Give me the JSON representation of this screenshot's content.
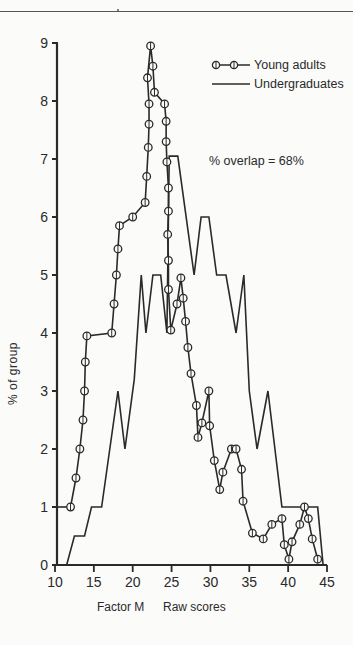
{
  "chart_data": {
    "type": "line",
    "title": "",
    "xlabel": "Factor M     Raw scores",
    "xlabel_parts": [
      "Factor M",
      "Raw scores"
    ],
    "ylabel": "% of group",
    "xlim": [
      10,
      45
    ],
    "ylim": [
      0,
      9
    ],
    "x_ticks": [
      10,
      15,
      20,
      25,
      30,
      35,
      40,
      45
    ],
    "y_ticks": [
      0,
      1,
      2,
      3,
      4,
      5,
      6,
      7,
      8,
      9
    ],
    "grid": false,
    "legend_position": "upper right",
    "annotation": "% overlap = 68%",
    "series": [
      {
        "name": "Young adults",
        "style": "line-with-open-circles",
        "points": [
          [
            12.0,
            1.0
          ],
          [
            12.7,
            1.5
          ],
          [
            13.2,
            2.0
          ],
          [
            13.6,
            2.5
          ],
          [
            13.8,
            3.0
          ],
          [
            13.9,
            3.5
          ],
          [
            14.1,
            3.95
          ],
          [
            17.3,
            4.0
          ],
          [
            17.6,
            4.5
          ],
          [
            17.9,
            5.0
          ],
          [
            18.1,
            5.45
          ],
          [
            18.3,
            5.85
          ],
          [
            20.0,
            6.0
          ],
          [
            21.6,
            6.25
          ],
          [
            21.8,
            6.7
          ],
          [
            22.0,
            7.2
          ],
          [
            22.1,
            7.6
          ],
          [
            22.1,
            7.95
          ],
          [
            21.9,
            8.4
          ],
          [
            22.3,
            8.95
          ],
          [
            22.6,
            8.6
          ],
          [
            22.8,
            8.15
          ],
          [
            24.1,
            7.95
          ],
          [
            24.3,
            7.65
          ],
          [
            24.3,
            7.3
          ],
          [
            24.4,
            6.95
          ],
          [
            24.6,
            6.5
          ],
          [
            24.6,
            6.1
          ],
          [
            24.5,
            5.7
          ],
          [
            24.6,
            5.25
          ],
          [
            24.6,
            4.75
          ],
          [
            24.9,
            4.05
          ],
          [
            25.7,
            4.5
          ],
          [
            26.2,
            4.95
          ],
          [
            26.5,
            4.6
          ],
          [
            26.8,
            4.2
          ],
          [
            27.1,
            3.75
          ],
          [
            27.5,
            3.3
          ],
          [
            28.2,
            2.75
          ],
          [
            28.4,
            2.2
          ],
          [
            28.9,
            2.45
          ],
          [
            29.8,
            3.0
          ],
          [
            29.9,
            2.4
          ],
          [
            30.5,
            1.8
          ],
          [
            31.2,
            1.3
          ],
          [
            31.6,
            1.6
          ],
          [
            32.7,
            2.0
          ],
          [
            33.3,
            2.0
          ],
          [
            34.0,
            1.65
          ],
          [
            34.2,
            1.1
          ],
          [
            35.4,
            0.55
          ],
          [
            36.8,
            0.45
          ],
          [
            37.9,
            0.7
          ],
          [
            39.2,
            0.8
          ],
          [
            39.5,
            0.35
          ],
          [
            40.1,
            0.1
          ],
          [
            40.5,
            0.4
          ],
          [
            41.5,
            0.7
          ],
          [
            42.1,
            1.0
          ],
          [
            42.6,
            0.8
          ],
          [
            43.1,
            0.45
          ],
          [
            43.8,
            0.1
          ]
        ]
      },
      {
        "name": "Undergraduates",
        "style": "plain-line",
        "points": [
          [
            11.5,
            0.0
          ],
          [
            12.5,
            0.5
          ],
          [
            13.8,
            0.5
          ],
          [
            14.7,
            1.0
          ],
          [
            16.0,
            1.0
          ],
          [
            18.1,
            3.0
          ],
          [
            19.0,
            2.0
          ],
          [
            20.2,
            3.2
          ],
          [
            21.1,
            5.0
          ],
          [
            21.7,
            4.0
          ],
          [
            22.6,
            5.0
          ],
          [
            23.6,
            5.0
          ],
          [
            24.4,
            4.0
          ],
          [
            24.7,
            7.05
          ],
          [
            25.8,
            7.05
          ],
          [
            27.9,
            5.0
          ],
          [
            28.8,
            6.0
          ],
          [
            29.8,
            6.0
          ],
          [
            30.8,
            5.0
          ],
          [
            32.0,
            5.0
          ],
          [
            33.3,
            4.0
          ],
          [
            34.3,
            5.0
          ],
          [
            35.0,
            3.0
          ],
          [
            36.0,
            2.0
          ],
          [
            37.4,
            3.0
          ],
          [
            39.2,
            1.0
          ],
          [
            43.8,
            1.0
          ],
          [
            44.5,
            0.0
          ]
        ]
      }
    ]
  },
  "legend": {
    "items": [
      {
        "label": "Young adults"
      },
      {
        "label": "Undergraduates"
      }
    ]
  },
  "axis": {
    "ylabel": "% of group",
    "xlabel_left": "Factor M",
    "xlabel_right": "Raw scores"
  },
  "annotation": "% overlap = 68%",
  "colors": {
    "ink": "#2a2a2a",
    "paper": "#fbfbfa"
  }
}
